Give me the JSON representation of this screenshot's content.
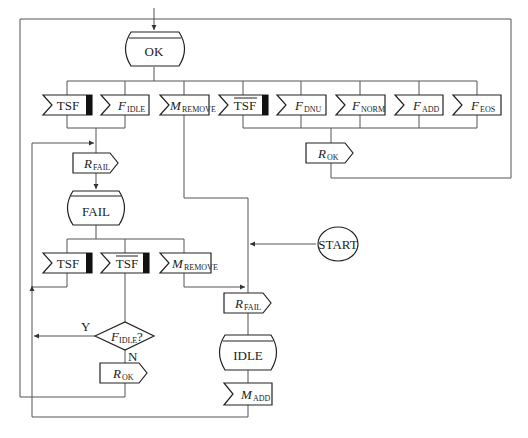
{
  "diagram": {
    "type": "SDL state machine",
    "states": {
      "ok": "OK",
      "fail": "FAIL",
      "idle": "IDLE",
      "start": "START"
    },
    "ok_inputs": [
      {
        "main": "TSF",
        "sub": "",
        "overline": false,
        "save_bar": true
      },
      {
        "main": "F",
        "sub": "IDLE",
        "overline": false,
        "save_bar": false
      },
      {
        "main": "M",
        "sub": "REMOVE",
        "overline": false,
        "save_bar": false
      },
      {
        "main": "TSF",
        "sub": "",
        "overline": true,
        "save_bar": true
      },
      {
        "main": "F",
        "sub": "DNU",
        "overline": false,
        "save_bar": false
      },
      {
        "main": "F",
        "sub": "NORM",
        "overline": false,
        "save_bar": false
      },
      {
        "main": "F",
        "sub": "ADD",
        "overline": false,
        "save_bar": false
      },
      {
        "main": "F",
        "sub": "EOS",
        "overline": false,
        "save_bar": false
      }
    ],
    "fail_inputs": [
      {
        "main": "TSF",
        "sub": "",
        "overline": false,
        "save_bar": true
      },
      {
        "main": "TSF",
        "sub": "",
        "overline": true,
        "save_bar": true
      },
      {
        "main": "M",
        "sub": "REMOVE",
        "overline": false,
        "save_bar": false
      }
    ],
    "outputs": {
      "r_fail_1": {
        "main": "R",
        "sub": "FAIL"
      },
      "r_ok_right": {
        "main": "R",
        "sub": "OK"
      },
      "r_ok_decision": {
        "main": "R",
        "sub": "OK"
      },
      "r_fail_2": {
        "main": "R",
        "sub": "FAIL"
      }
    },
    "idle_input": {
      "main": "M",
      "sub": "ADD"
    },
    "decision": {
      "main": "F",
      "sub": "IDLE",
      "suffix": "?",
      "yes": "Y",
      "no": "N"
    }
  }
}
